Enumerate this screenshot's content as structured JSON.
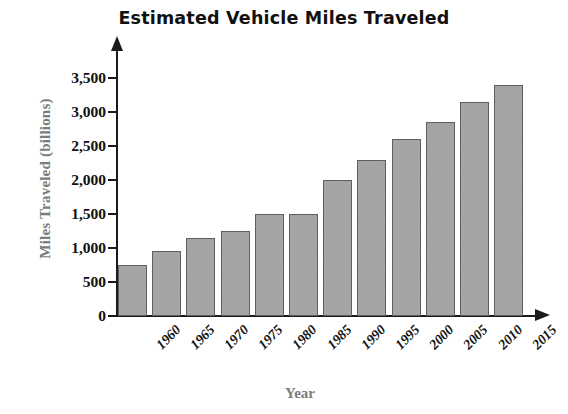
{
  "chart_data": {
    "type": "bar",
    "title": "Estimated Vehicle Miles Traveled",
    "xlabel": "Year",
    "ylabel": "Miles Traveled (billions)",
    "categories": [
      "1960",
      "1965",
      "1970",
      "1975",
      "1980",
      "1985",
      "1990",
      "1995",
      "2000",
      "2005",
      "2010",
      "2015"
    ],
    "values": [
      750,
      950,
      1150,
      1250,
      1500,
      1500,
      2000,
      2300,
      2600,
      2850,
      3150,
      3400
    ],
    "ylim": [
      0,
      3500
    ],
    "ytick_labels": [
      "0",
      "500",
      "1,000",
      "1,500",
      "2,000",
      "2,500",
      "3,000",
      "3,500"
    ],
    "ytick_values": [
      0,
      500,
      1000,
      1500,
      2000,
      2500,
      3000,
      3500
    ],
    "grid": false,
    "legend": false,
    "bar_color": "#9c9c9c",
    "bar_border_color": "#5f5f5f",
    "axis_color": "#1a1a1a",
    "axis_label_color": "#7b7b7b",
    "title_color": "#111111",
    "background": "#ffffff"
  }
}
